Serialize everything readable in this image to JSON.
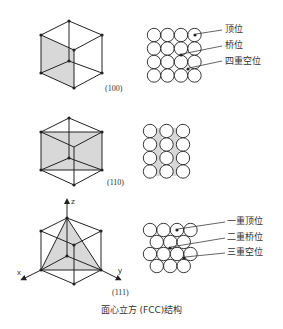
{
  "caption": "面心立方 (FCC)结构",
  "panels": [
    {
      "plane": "(100)",
      "sites": [
        "顶位",
        "桥位",
        "四重空位"
      ]
    },
    {
      "plane": "(110)",
      "sites": []
    },
    {
      "plane": "(111)",
      "sites": [
        "一重顶位",
        "二重桥位",
        "三重空位"
      ],
      "axes": {
        "z": "z",
        "x": "x",
        "y": "y"
      }
    }
  ],
  "colors": {
    "line": "#222222",
    "shade": "#d8d8d8",
    "text": "#333333"
  }
}
